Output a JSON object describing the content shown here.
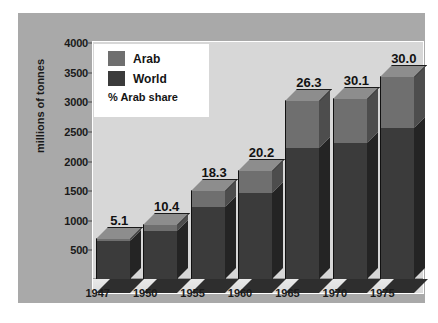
{
  "chart_data": {
    "type": "bar",
    "title": "",
    "subtitle": "",
    "xlabel": "",
    "ylabel": "millions of tonnes",
    "ylim": [
      0,
      4000
    ],
    "ytick_labels": [
      "500",
      "1000",
      "1500",
      "2000",
      "2500",
      "3000",
      "3500",
      "4000"
    ],
    "ytick_values": [
      500,
      1000,
      1500,
      2000,
      2500,
      3000,
      3500,
      4000
    ],
    "grid": false,
    "stacked": true,
    "legend_position": "top-left",
    "categories": [
      "1947",
      "1950",
      "1955",
      "1960",
      "1965",
      "1970",
      "1975"
    ],
    "series": [
      {
        "name": "World",
        "color": "#3b3b3b",
        "values": [
          645,
          810,
          1210,
          1450,
          2210,
          2290,
          2550
        ]
      },
      {
        "name": "Arab",
        "color": "#6f6f6f",
        "values": [
          35,
          95,
          270,
          365,
          790,
          750,
          865
        ]
      }
    ],
    "totals": [
      680,
      905,
      1480,
      1815,
      3000,
      3040,
      3415
    ],
    "annotations": [
      "5.1",
      "10.4",
      "18.3",
      "20.2",
      "26.3",
      "30.1",
      "30.0"
    ],
    "annotation_label": "% Arab share"
  },
  "legend": {
    "items": [
      {
        "label": "Arab",
        "color": "#6f6f6f"
      },
      {
        "label": "World",
        "color": "#3b3b3b"
      }
    ],
    "note": "% Arab share"
  },
  "colors": {
    "outer_background": "#ffffff",
    "panel_background": "#a9a9a9",
    "plot_background": "#d7d7d7",
    "arab": "#6f6f6f",
    "world": "#3b3b3b",
    "text": "#141414"
  }
}
